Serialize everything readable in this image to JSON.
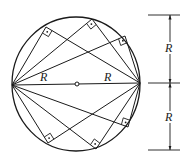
{
  "figure": {
    "stroke_color": "#1a1a1a",
    "background": "#ffffff",
    "circle": {
      "cx": 76,
      "cy": 84,
      "rx": 64,
      "ry": 67
    },
    "center_point": {
      "x": 77,
      "y": 84
    },
    "diameter": {
      "left": {
        "x": 12,
        "y": 85
      },
      "right": {
        "x": 140,
        "y": 83
      }
    },
    "radius_labels": [
      {
        "text": "R",
        "x": 40,
        "y": 81
      },
      {
        "text": "R",
        "x": 104,
        "y": 81
      }
    ],
    "right_angle_vertices": [
      {
        "x": 46,
        "y": 27
      },
      {
        "x": 92,
        "y": 19
      },
      {
        "x": 125,
        "y": 36
      },
      {
        "x": 48,
        "y": 143
      },
      {
        "x": 96,
        "y": 149
      },
      {
        "x": 128,
        "y": 127
      }
    ],
    "marker_size": 7
  },
  "dimension": {
    "line_x": 170,
    "tick_x1": 148,
    "tick_x2": 180,
    "levels": [
      15,
      83,
      150
    ],
    "labels": [
      {
        "text": "R",
        "x": 165,
        "y": 52
      },
      {
        "text": "R",
        "x": 165,
        "y": 121
      }
    ]
  }
}
